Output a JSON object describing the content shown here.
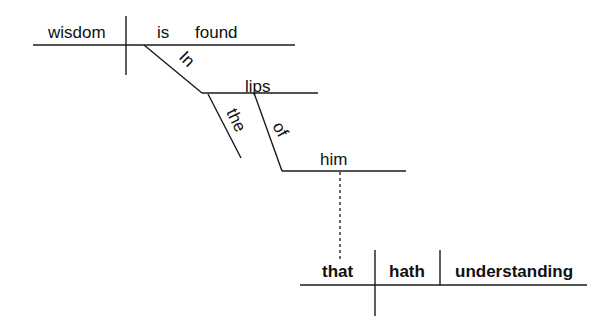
{
  "diagram": {
    "type": "Reed-Kellogg sentence diagram",
    "sentence": "Wisdom is found in the lips of him that hath understanding",
    "main_clause": {
      "subject": "wisdom",
      "verb_aux": "is",
      "verb": "found",
      "prep_phrase_1": {
        "preposition": "In",
        "object": "lips",
        "modifier": "the",
        "prep_phrase_2": {
          "preposition": "of",
          "object": "him"
        }
      }
    },
    "relative_clause": {
      "subject": "that",
      "verb": "hath",
      "object": "understanding"
    },
    "colors": {
      "line": "#1a1a1a",
      "text": "#111111",
      "background": "#ffffff"
    }
  }
}
